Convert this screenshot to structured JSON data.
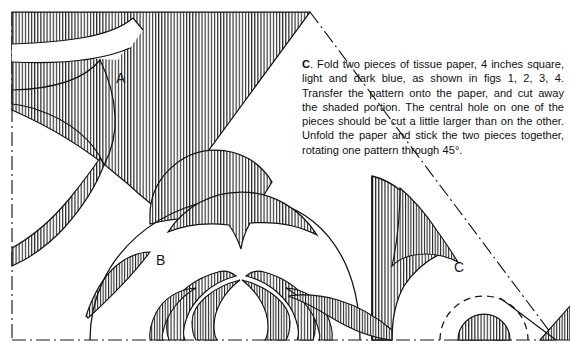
{
  "figure": {
    "background_color": "#ffffff",
    "ink_color": "#1a1a1a",
    "hatch_style": "vertical line shading",
    "labels": [
      {
        "id": "A",
        "text": "A",
        "x": 122,
        "y": 78
      },
      {
        "id": "B",
        "text": "B",
        "x": 163,
        "y": 260
      },
      {
        "id": "C",
        "text": "C",
        "x": 461,
        "y": 267
      }
    ],
    "fold_lines": "dash-dot",
    "alternate_cut_lines": "dashed"
  },
  "caption": {
    "lead": "C",
    "lead_suffix": ".",
    "body": " Fold two pieces of tissue paper, 4 inches square, light and dark blue, as shown in figs 1, 2, 3, 4. Transfer the pattern onto the paper, and cut away the shaded portion. The central hole on one of the pieces should be cut a little larger than on the other. Unfold the paper and stick the two pieces together, rotating one pattern through 45°."
  }
}
